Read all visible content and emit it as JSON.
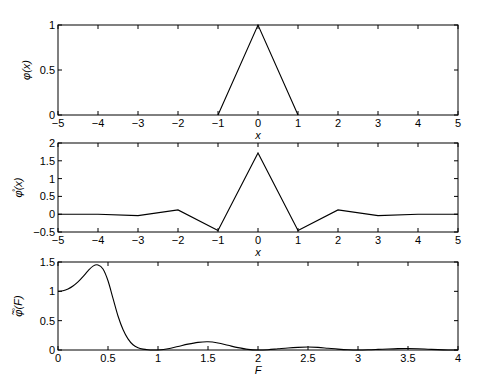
{
  "chart_data": [
    {
      "type": "line",
      "title": "",
      "xlabel": "x",
      "ylabel": "φ(x)",
      "xlim": [
        -5,
        5
      ],
      "ylim": [
        0,
        1
      ],
      "xticks": [
        "-5",
        "-4",
        "-3",
        "-2",
        "-1",
        "0",
        "1",
        "2",
        "3",
        "4",
        "5"
      ],
      "yticks": [
        "0",
        "0.5",
        "1"
      ],
      "grid": false,
      "series": [
        {
          "name": "phi",
          "x": [
            -1,
            0,
            1
          ],
          "values": [
            0,
            1,
            0
          ]
        }
      ]
    },
    {
      "type": "line",
      "title": "",
      "xlabel": "x",
      "ylabel": "φ̊(x)",
      "xlim": [
        -5,
        5
      ],
      "ylim": [
        -0.5,
        2
      ],
      "xticks": [
        "-5",
        "-4",
        "-3",
        "-2",
        "-1",
        "0",
        "1",
        "2",
        "3",
        "4",
        "5"
      ],
      "yticks": [
        "-0.5",
        "0",
        "0.5",
        "1",
        "1.5",
        "2"
      ],
      "grid": false,
      "series": [
        {
          "name": "phi_ring",
          "x": [
            -5,
            -4,
            -3,
            -2,
            -1,
            0,
            1,
            2,
            3,
            4,
            5
          ],
          "values": [
            0.0,
            0.0,
            -0.04,
            0.12,
            -0.46,
            1.72,
            -0.46,
            0.12,
            -0.04,
            0.0,
            0.0
          ]
        }
      ]
    },
    {
      "type": "line",
      "title": "",
      "xlabel": "F",
      "ylabel": "φ̊̃(F)",
      "xlim": [
        0,
        4
      ],
      "ylim": [
        0,
        1.5
      ],
      "xticks": [
        "0",
        "0.5",
        "1",
        "1.5",
        "2",
        "2.5",
        "3",
        "3.5",
        "4"
      ],
      "yticks": [
        "0",
        "0.5",
        "1",
        "1.5"
      ],
      "grid": false,
      "series": [
        {
          "name": "phi_ring_tilde",
          "x": [
            0,
            0.05,
            0.1,
            0.15,
            0.2,
            0.25,
            0.3,
            0.35,
            0.4,
            0.45,
            0.5,
            0.55,
            0.6,
            0.65,
            0.7,
            0.75,
            0.8,
            0.85,
            0.9,
            0.95,
            1.0,
            1.1,
            1.2,
            1.3,
            1.4,
            1.5,
            1.6,
            1.7,
            1.8,
            1.9,
            2.0,
            2.1,
            2.2,
            2.3,
            2.4,
            2.5,
            2.6,
            2.7,
            2.8,
            2.9,
            3.0,
            3.1,
            3.2,
            3.3,
            3.4,
            3.5,
            3.6,
            3.7,
            3.8,
            3.9,
            4.0
          ],
          "values": [
            1.0,
            1.01,
            1.04,
            1.09,
            1.16,
            1.25,
            1.35,
            1.43,
            1.45,
            1.38,
            1.18,
            0.88,
            0.58,
            0.35,
            0.19,
            0.09,
            0.04,
            0.015,
            0.004,
            0.0,
            0.0,
            0.02,
            0.06,
            0.1,
            0.13,
            0.14,
            0.12,
            0.08,
            0.04,
            0.01,
            0.0,
            0.005,
            0.02,
            0.035,
            0.045,
            0.05,
            0.045,
            0.03,
            0.015,
            0.004,
            0.0,
            0.003,
            0.01,
            0.018,
            0.024,
            0.026,
            0.022,
            0.014,
            0.006,
            0.001,
            0.0
          ]
        }
      ]
    }
  ]
}
